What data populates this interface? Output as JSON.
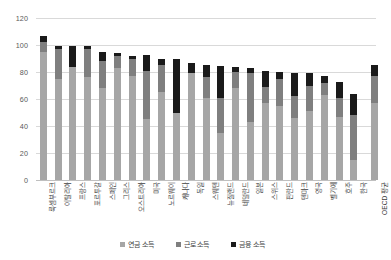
{
  "chart_data": {
    "type": "bar",
    "subtype": "stacked-column",
    "title": "",
    "xlabel": "",
    "ylabel": "",
    "ylim": [
      0,
      120
    ],
    "yticks": [
      0,
      20,
      40,
      60,
      80,
      100,
      120
    ],
    "grid": true,
    "legend_position": "bottom",
    "categories": [
      "룩셈부르크",
      "이탈리아",
      "프랑스",
      "포르투갈",
      "스페인",
      "그리스",
      "오스트리아",
      "미국",
      "노르웨이",
      "캐나다",
      "독일",
      "스웨덴",
      "뉴질랜드",
      "네덜란드",
      "일본",
      "스위스",
      "핀란드",
      "덴마크",
      "영국",
      "벨기에",
      "호주",
      "한국",
      "OECD 평균"
    ],
    "series": [
      {
        "name": "연금 소득",
        "color": "#a6a6a6",
        "values": [
          95.0,
          75.0,
          84.0,
          76.0,
          68.0,
          83.0,
          77.0,
          45.0,
          65.0,
          50.0,
          79.0,
          61.0,
          35.0,
          68.0,
          43.0,
          57.0,
          55.0,
          46.0,
          51.0,
          63.0,
          47.0,
          15.0,
          57.0
        ]
      },
      {
        "name": "근로 소득",
        "color": "#7f7f7f",
        "values": [
          7.0,
          22.0,
          0.0,
          21.0,
          20.0,
          9.0,
          13.0,
          36.0,
          20.0,
          0.0,
          0.0,
          15.0,
          26.0,
          12.0,
          36.0,
          12.0,
          20.0,
          16.0,
          19.0,
          9.0,
          14.0,
          33.0,
          20.0
        ]
      },
      {
        "name": "금융 소득",
        "color": "#1a1a1a",
        "values": [
          5.0,
          2.0,
          15.0,
          2.0,
          6.5,
          2.0,
          2.0,
          11.5,
          5.0,
          40.0,
          8.0,
          9.0,
          23.5,
          3.5,
          4.0,
          12.0,
          5.0,
          17.5,
          9.0,
          5.0,
          11.5,
          15.5,
          8.0
        ]
      }
    ],
    "totals": [
      107.0,
      99.0,
      99.0,
      99.0,
      94.5,
      94.0,
      92.0,
      92.5,
      90.0,
      90.0,
      87.0,
      85.0,
      84.5,
      83.5,
      83.0,
      81.0,
      80.0,
      79.5,
      79.0,
      77.0,
      72.5,
      63.5,
      85.0
    ]
  },
  "legend": {
    "items": [
      {
        "label": "연금 소득",
        "color": "#a6a6a6",
        "swatch_name": "legend-swatch-pension"
      },
      {
        "label": "근로 소득",
        "color": "#7f7f7f",
        "swatch_name": "legend-swatch-work"
      },
      {
        "label": "금융 소득",
        "color": "#1a1a1a",
        "swatch_name": "legend-swatch-capital"
      }
    ]
  }
}
